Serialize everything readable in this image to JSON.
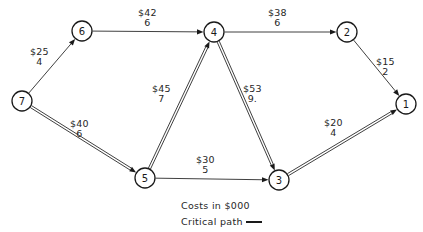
{
  "diagram": {
    "nodes": [
      {
        "id": "1",
        "label": "1",
        "x": 406,
        "y": 104,
        "r": 10
      },
      {
        "id": "2",
        "label": "2",
        "x": 347,
        "y": 32,
        "r": 10
      },
      {
        "id": "3",
        "label": "3",
        "x": 279,
        "y": 180,
        "r": 10
      },
      {
        "id": "4",
        "label": "4",
        "x": 214,
        "y": 32,
        "r": 10
      },
      {
        "id": "5",
        "label": "5",
        "x": 145,
        "y": 178,
        "r": 10
      },
      {
        "id": "6",
        "label": "6",
        "x": 82,
        "y": 31,
        "r": 10
      },
      {
        "id": "7",
        "label": "7",
        "x": 22,
        "y": 101,
        "r": 10
      }
    ],
    "edges": [
      {
        "id": "7-6",
        "from": "7",
        "to": "6",
        "cost": "$25",
        "duration": "4",
        "critical": false,
        "label_x": 30,
        "label_y": 47
      },
      {
        "id": "6-4",
        "from": "6",
        "to": "4",
        "cost": "$42",
        "duration": "6",
        "critical": false,
        "label_x": 138,
        "label_y": 8
      },
      {
        "id": "4-2",
        "from": "4",
        "to": "2",
        "cost": "$38",
        "duration": "6",
        "critical": false,
        "label_x": 268,
        "label_y": 8
      },
      {
        "id": "2-1",
        "from": "2",
        "to": "1",
        "cost": "$15",
        "duration": "2",
        "critical": false,
        "label_x": 376,
        "label_y": 57
      },
      {
        "id": "7-5",
        "from": "7",
        "to": "5",
        "cost": "$40",
        "duration": "6",
        "critical": true,
        "label_x": 70,
        "label_y": 119
      },
      {
        "id": "5-4",
        "from": "5",
        "to": "4",
        "cost": "$45",
        "duration": "7",
        "critical": true,
        "label_x": 152,
        "label_y": 84
      },
      {
        "id": "4-3",
        "from": "4",
        "to": "3",
        "cost": "$53",
        "duration": "9.",
        "critical": true,
        "label_x": 243,
        "label_y": 84
      },
      {
        "id": "5-3",
        "from": "5",
        "to": "3",
        "cost": "$30",
        "duration": "5",
        "critical": false,
        "label_x": 196,
        "label_y": 155
      },
      {
        "id": "3-1",
        "from": "3",
        "to": "1",
        "cost": "$20",
        "duration": "4",
        "critical": true,
        "label_x": 324,
        "label_y": 118
      }
    ],
    "legend": {
      "costs_note": "Costs in $000",
      "critical_path_label": "Critical path"
    },
    "colors": {
      "ink": "#1a1a1a",
      "line": "#2a2a2a",
      "background": "#ffffff"
    }
  }
}
